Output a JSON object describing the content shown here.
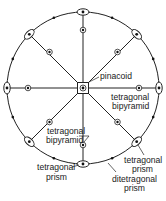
{
  "diagram": {
    "center": [
      83,
      88
    ],
    "radius": 76,
    "colors": {
      "stroke": "#222222",
      "text": "#1a1a1a",
      "background": "#ffffff"
    },
    "labels": {
      "pinacoid": "pinacoid",
      "tet_bipyramid_right_1": "tetragonal",
      "tet_bipyramid_right_2": "bipyramid",
      "tet_bipyramid_left_1": "tetragonal",
      "tet_bipyramid_left_2": "bipyramid",
      "tet_prism_right_1": "tetragonal",
      "tet_prism_right_2": "prism",
      "tet_prism_bottom_1": "tetragonal",
      "tet_prism_bottom_2": "prism",
      "ditet_prism_1": "ditetragonal",
      "ditet_prism_2": "prism"
    },
    "symmetry_elements": {
      "center": "4-fold axis (square) with face pole",
      "primitive_2fold": "2-fold axes (lens symbols) at 8 positions",
      "inner_poles": "bipyramid face poles (circled dots)"
    }
  }
}
